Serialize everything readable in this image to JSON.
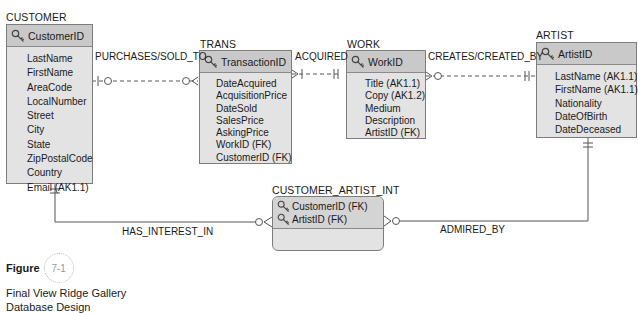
{
  "entities": {
    "customer": {
      "name": "CUSTOMER",
      "key": "CustomerID",
      "attributes": [
        "LastName",
        "FirstName",
        "AreaCode",
        "LocalNumber",
        "Street",
        "City",
        "State",
        "ZipPostalCode",
        "Country",
        "Email (AK1.1)"
      ]
    },
    "trans": {
      "name": "TRANS",
      "key": "TransactionID",
      "attributes": [
        "DateAcquired",
        "AcquisitionPrice",
        "DateSold",
        "SalesPrice",
        "AskingPrice",
        "WorkID (FK)",
        "CustomerID (FK)"
      ]
    },
    "work": {
      "name": "WORK",
      "key": "WorkID",
      "attributes": [
        "Title (AK1.1)",
        "Copy (AK1.2)",
        "Medium",
        "Description",
        "ArtistID (FK)"
      ]
    },
    "artist": {
      "name": "ARTIST",
      "key": "ArtistID",
      "attributes": [
        "LastName (AK1.1)",
        "FirstName (AK1.1)",
        "Nationality",
        "DateOfBirth",
        "DateDeceased"
      ]
    },
    "customer_artist_int": {
      "name": "CUSTOMER_ARTIST_INT",
      "keys": [
        "CustomerID (FK)",
        "ArtistID (FK)"
      ]
    }
  },
  "relationships": {
    "purchases": "PURCHASES/SOLD_TO",
    "acquired": "ACQUIRED",
    "creates": "CREATES/CREATED_BY",
    "has_interest": "HAS_INTEREST_IN",
    "admired_by": "ADMIRED_BY"
  },
  "figure": {
    "word": "Figure",
    "number": "7-1",
    "caption_line1": "Final View Ridge Gallery",
    "caption_line2": "Database Design"
  },
  "icons": {
    "key": "key-icon"
  },
  "colors": {
    "header_bg": "#c9c9c9",
    "body_bg": "#e3e3e3",
    "border": "#7c7c7c",
    "line": "#555555"
  }
}
